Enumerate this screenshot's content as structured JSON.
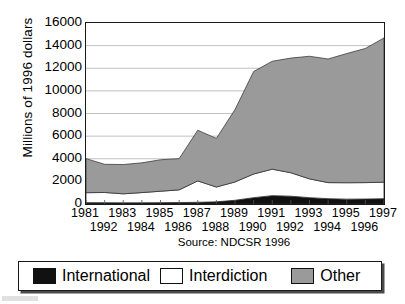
{
  "chart_data": {
    "type": "area",
    "title": "",
    "subtitle": "",
    "xlabel": "",
    "ylabel": "Millions of 1996 dollars",
    "source": "Source: NDCSR 1996",
    "stacked": true,
    "grid": true,
    "legend_position": "bottom",
    "ylim": [
      0,
      16000
    ],
    "ytick_labels": [
      "16000",
      "14000",
      "12000",
      "10000",
      "8000",
      "6000",
      "4000",
      "2000",
      "0"
    ],
    "ytick_values": [
      16000,
      14000,
      12000,
      10000,
      8000,
      6000,
      4000,
      2000,
      0
    ],
    "xtick_labels_row1": [
      "1981",
      "1983",
      "1985",
      "1987",
      "1989",
      "1991",
      "1993",
      "1995",
      "1997"
    ],
    "xtick_labels_row2": [
      "1992",
      "1984",
      "1986",
      "1988",
      "1990",
      "1992",
      "1994",
      "1996"
    ],
    "x": [
      1981,
      1982,
      1983,
      1984,
      1985,
      1986,
      1987,
      1988,
      1989,
      1990,
      1991,
      1992,
      1993,
      1994,
      1995,
      1996,
      1997
    ],
    "series": [
      {
        "name": "International",
        "color": "#111111",
        "values": [
          120,
          115,
          105,
          110,
          120,
          130,
          150,
          190,
          330,
          560,
          740,
          690,
          560,
          470,
          430,
          440,
          470
        ]
      },
      {
        "name": "Interdiction",
        "color": "#ffffff",
        "values": [
          880,
          905,
          795,
          900,
          1010,
          1120,
          1890,
          1310,
          1620,
          2090,
          2340,
          2070,
          1660,
          1420,
          1450,
          1450,
          1460
        ]
      },
      {
        "name": "Other",
        "color": "#9a9a9a",
        "values": [
          3010,
          2490,
          2590,
          2630,
          2780,
          2760,
          4480,
          4300,
          6400,
          9060,
          9540,
          10140,
          10840,
          10930,
          11420,
          11860,
          12750
        ]
      }
    ],
    "totals": [
      4010,
      3510,
      3490,
      3640,
      3910,
      4010,
      6520,
      5800,
      8350,
      11710,
      12620,
      12900,
      13060,
      12820,
      13300,
      13750,
      14680
    ]
  },
  "legend": {
    "items": [
      {
        "label": "International",
        "swatch": "#111111"
      },
      {
        "label": "Interdiction",
        "swatch": "#ffffff"
      },
      {
        "label": "Other",
        "swatch": "#9a9a9a"
      }
    ]
  }
}
